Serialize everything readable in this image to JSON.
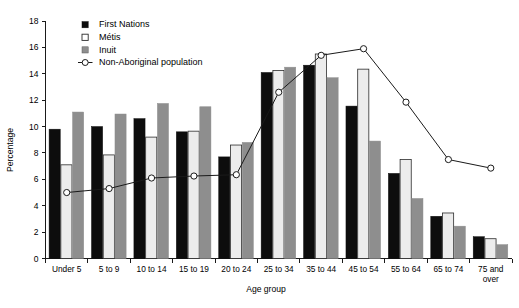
{
  "chart_data": {
    "type": "bar",
    "title": "",
    "xlabel": "Age group",
    "ylabel": "Percentage",
    "ylim": [
      0,
      18
    ],
    "ytick_step": 2,
    "yticks": [
      "0",
      "2",
      "4",
      "6",
      "8",
      "10",
      "12",
      "14",
      "16",
      "18"
    ],
    "grid": false,
    "legend_position": "top-left",
    "categories": [
      "Under 5",
      "5 to 9",
      "10 to 14",
      "15 to 19",
      "20 to 24",
      "25 to 34",
      "35 to 44",
      "45 to 54",
      "55 to 64",
      "65 to 74",
      "75 and over"
    ],
    "series": [
      {
        "name": "First Nations",
        "marker": "filled-square",
        "color": "#0d0d0d",
        "render": "bar",
        "values": [
          9.8,
          10.0,
          10.6,
          9.6,
          7.7,
          14.1,
          14.65,
          11.55,
          6.45,
          3.2,
          1.65
        ]
      },
      {
        "name": "Métis",
        "marker": "open-square",
        "color": "#ececec",
        "render": "bar",
        "values": [
          7.1,
          7.85,
          9.2,
          9.65,
          8.6,
          14.25,
          15.5,
          14.35,
          7.5,
          3.45,
          1.5
        ]
      },
      {
        "name": "Inuit",
        "marker": "grey-square",
        "color": "#8e8e8e",
        "render": "bar",
        "values": [
          11.1,
          10.95,
          11.75,
          11.5,
          8.8,
          14.5,
          13.7,
          8.9,
          4.55,
          2.45,
          1.05
        ]
      },
      {
        "name": "Non-Aboriginal population",
        "marker": "open-circle-line",
        "color": "#1a1a1a",
        "render": "line",
        "values": [
          5.0,
          5.3,
          6.1,
          6.25,
          6.35,
          12.6,
          15.4,
          15.9,
          11.85,
          7.5,
          6.85
        ]
      }
    ]
  },
  "axis": {
    "y_title": "Percentage",
    "x_title": "Age group"
  },
  "legend": {
    "items": [
      {
        "label": "First Nations"
      },
      {
        "label": "Métis"
      },
      {
        "label": "Inuit"
      },
      {
        "label": "Non-Aboriginal population"
      }
    ]
  }
}
